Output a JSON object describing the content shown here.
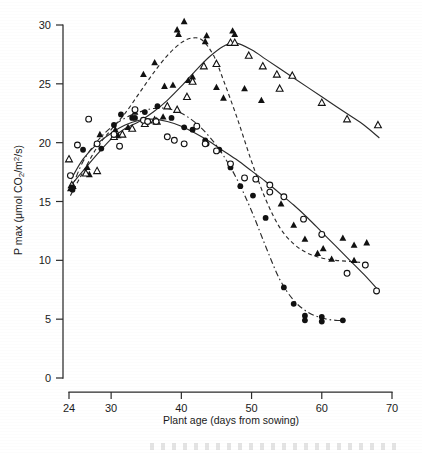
{
  "figure": {
    "background_color": "#ffffff",
    "ink_color": "#111111"
  },
  "chart_data": {
    "type": "scatter",
    "title": "",
    "subtitle": "",
    "xlabel": "Plant age (days from sowing)",
    "ylabel": "P max (μmol CO₂/m²/s)",
    "xlim": [
      24,
      70
    ],
    "ylim": [
      0,
      30
    ],
    "xticks": [
      24,
      30,
      40,
      50,
      60,
      70
    ],
    "xticklabels": [
      "24",
      "30",
      "40",
      "50",
      "60",
      "70"
    ],
    "yticks": [
      0,
      5,
      10,
      15,
      20,
      25,
      30
    ],
    "yticklabels": [
      "0",
      "5",
      "10",
      "15",
      "20",
      "25",
      "30"
    ],
    "grid": false,
    "legend": "none",
    "axis_style": "offset-spines",
    "series": [
      {
        "name": "filled-triangle",
        "marker": "triangle-filled",
        "line": "dashed",
        "points": [
          [
            24.0,
            18.6
          ],
          [
            24.2,
            16.1
          ],
          [
            24.6,
            16.3
          ],
          [
            26.6,
            17.9
          ],
          [
            26.9,
            17.3
          ],
          [
            28.4,
            20.7
          ],
          [
            30.6,
            21.1
          ],
          [
            31.0,
            20.6
          ],
          [
            32.4,
            21.3
          ],
          [
            33.4,
            22.6
          ],
          [
            34.6,
            25.8
          ],
          [
            36.2,
            26.8
          ],
          [
            37.4,
            22.2
          ],
          [
            37.6,
            24.8
          ],
          [
            38.8,
            24.9
          ],
          [
            39.4,
            29.6
          ],
          [
            39.6,
            29.2
          ],
          [
            40.4,
            30.3
          ],
          [
            41.0,
            25.3
          ],
          [
            41.6,
            25.6
          ],
          [
            43.4,
            28.6
          ],
          [
            43.6,
            29.1
          ],
          [
            45.0,
            24.7
          ],
          [
            46.0,
            23.8
          ],
          [
            47.3,
            29.5
          ],
          [
            47.6,
            29.2
          ],
          [
            49.0,
            24.6
          ],
          [
            51.4,
            23.6
          ],
          [
            54.2,
            14.8
          ],
          [
            56.0,
            13.0
          ],
          [
            57.6,
            11.8
          ],
          [
            59.4,
            10.6
          ],
          [
            60.2,
            11.0
          ],
          [
            61.4,
            10.1
          ],
          [
            63.0,
            11.9
          ],
          [
            64.6,
            11.3
          ],
          [
            64.6,
            10.0
          ],
          [
            66.4,
            11.5
          ]
        ]
      },
      {
        "name": "open-triangle",
        "marker": "triangle-open",
        "line": "solid",
        "points": [
          [
            24.0,
            18.6
          ],
          [
            24.4,
            16.4
          ],
          [
            26.4,
            17.4
          ],
          [
            28.0,
            17.6
          ],
          [
            30.4,
            20.5
          ],
          [
            31.6,
            20.7
          ],
          [
            33.0,
            21.2
          ],
          [
            34.8,
            21.6
          ],
          [
            36.2,
            21.9
          ],
          [
            36.5,
            21.8
          ],
          [
            38.0,
            23.1
          ],
          [
            39.4,
            22.8
          ],
          [
            40.8,
            23.9
          ],
          [
            41.6,
            25.2
          ],
          [
            43.2,
            26.5
          ],
          [
            45.0,
            26.7
          ],
          [
            47.0,
            28.5
          ],
          [
            47.6,
            28.5
          ],
          [
            49.6,
            27.4
          ],
          [
            51.6,
            26.5
          ],
          [
            53.6,
            25.8
          ],
          [
            54.0,
            24.6
          ],
          [
            55.8,
            25.7
          ],
          [
            60.0,
            23.4
          ],
          [
            63.6,
            22.0
          ],
          [
            68.0,
            21.5
          ]
        ]
      },
      {
        "name": "filled-circle",
        "marker": "circle-filled",
        "line": "dash-dot",
        "points": [
          [
            24.4,
            16.2
          ],
          [
            24.5,
            16.0
          ],
          [
            26.0,
            19.4
          ],
          [
            28.6,
            19.5
          ],
          [
            30.4,
            21.5
          ],
          [
            31.4,
            22.4
          ],
          [
            33.0,
            22.1
          ],
          [
            33.4,
            22.1
          ],
          [
            34.8,
            22.6
          ],
          [
            36.6,
            23.1
          ],
          [
            38.6,
            22.1
          ],
          [
            40.4,
            21.3
          ],
          [
            41.6,
            21.1
          ],
          [
            43.4,
            20.2
          ],
          [
            43.6,
            19.9
          ],
          [
            45.4,
            19.4
          ],
          [
            47.0,
            17.9
          ],
          [
            48.4,
            16.3
          ],
          [
            50.2,
            15.5
          ],
          [
            52.0,
            13.6
          ],
          [
            54.6,
            7.7
          ],
          [
            56.0,
            6.3
          ],
          [
            57.6,
            5.3
          ],
          [
            57.6,
            4.9
          ],
          [
            60.0,
            5.2
          ],
          [
            60.0,
            4.8
          ],
          [
            63.0,
            4.9
          ]
        ]
      },
      {
        "name": "open-circle",
        "marker": "circle-open",
        "line": "solid",
        "points": [
          [
            24.2,
            17.2
          ],
          [
            25.2,
            19.8
          ],
          [
            26.8,
            22.0
          ],
          [
            28.0,
            19.9
          ],
          [
            30.4,
            20.7
          ],
          [
            31.2,
            19.7
          ],
          [
            33.4,
            22.8
          ],
          [
            34.6,
            21.9
          ],
          [
            35.2,
            21.8
          ],
          [
            36.4,
            21.8
          ],
          [
            38.0,
            20.5
          ],
          [
            39.0,
            20.2
          ],
          [
            40.4,
            19.9
          ],
          [
            42.2,
            21.4
          ],
          [
            43.4,
            19.9
          ],
          [
            45.0,
            19.3
          ],
          [
            47.0,
            18.2
          ],
          [
            49.0,
            17.0
          ],
          [
            50.6,
            16.9
          ],
          [
            52.6,
            16.4
          ],
          [
            52.6,
            15.8
          ],
          [
            54.6,
            15.4
          ],
          [
            57.4,
            13.5
          ],
          [
            60.0,
            12.2
          ],
          [
            63.6,
            8.9
          ],
          [
            66.2,
            9.6
          ],
          [
            67.8,
            7.4
          ]
        ]
      }
    ],
    "fit_curves": [
      {
        "name": "filled-triangle-fit",
        "style": "dashed",
        "path": [
          [
            24.2,
            15.5
          ],
          [
            26,
            17.5
          ],
          [
            28,
            19.6
          ],
          [
            30,
            21.1
          ],
          [
            32,
            22.5
          ],
          [
            34,
            24.2
          ],
          [
            36,
            25.9
          ],
          [
            38,
            27.4
          ],
          [
            40,
            28.5
          ],
          [
            41.6,
            28.9
          ],
          [
            43,
            28.7
          ],
          [
            44.6,
            27.4
          ],
          [
            46,
            25.3
          ],
          [
            48,
            22.0
          ],
          [
            50,
            18.4
          ],
          [
            52,
            15.2
          ],
          [
            54,
            12.8
          ],
          [
            56,
            11.4
          ],
          [
            58,
            10.6
          ],
          [
            60,
            10.2
          ],
          [
            62,
            10.0
          ],
          [
            64,
            9.9
          ],
          [
            66,
            9.8
          ]
        ]
      },
      {
        "name": "open-triangle-fit",
        "style": "solid",
        "path": [
          [
            24.3,
            16.4
          ],
          [
            26,
            17.6
          ],
          [
            28,
            19.0
          ],
          [
            30,
            20.3
          ],
          [
            32,
            21.2
          ],
          [
            34,
            21.8
          ],
          [
            36,
            22.6
          ],
          [
            38,
            23.6
          ],
          [
            40,
            24.8
          ],
          [
            42,
            26.1
          ],
          [
            44,
            27.3
          ],
          [
            46,
            28.2
          ],
          [
            47.6,
            28.5
          ],
          [
            50,
            27.9
          ],
          [
            52,
            27.1
          ],
          [
            54,
            26.3
          ],
          [
            56,
            25.5
          ],
          [
            58,
            24.7
          ],
          [
            60,
            23.9
          ],
          [
            62,
            23.1
          ],
          [
            64,
            22.3
          ],
          [
            66,
            21.5
          ],
          [
            68.2,
            20.4
          ]
        ]
      },
      {
        "name": "filled-circle-fit",
        "style": "dash-dot",
        "path": [
          [
            24.3,
            16.0
          ],
          [
            26,
            18.4
          ],
          [
            28,
            20.1
          ],
          [
            30,
            21.3
          ],
          [
            32,
            22.1
          ],
          [
            34,
            22.6
          ],
          [
            36,
            22.9
          ],
          [
            38,
            22.9
          ],
          [
            40,
            22.5
          ],
          [
            42,
            21.7
          ],
          [
            44,
            20.5
          ],
          [
            46,
            18.9
          ],
          [
            48,
            16.8
          ],
          [
            50,
            14.2
          ],
          [
            52,
            11.2
          ],
          [
            54,
            8.4
          ],
          [
            56,
            6.6
          ],
          [
            58,
            5.6
          ],
          [
            60,
            5.1
          ],
          [
            62,
            4.9
          ],
          [
            63.4,
            4.9
          ]
        ]
      },
      {
        "name": "open-circle-fit",
        "style": "solid",
        "path": [
          [
            24.3,
            16.9
          ],
          [
            26,
            18.6
          ],
          [
            28,
            19.9
          ],
          [
            30,
            20.8
          ],
          [
            32,
            21.5
          ],
          [
            34,
            21.9
          ],
          [
            36,
            22.0
          ],
          [
            38,
            21.8
          ],
          [
            40,
            21.4
          ],
          [
            42,
            20.8
          ],
          [
            44,
            20.1
          ],
          [
            46,
            19.3
          ],
          [
            48,
            18.5
          ],
          [
            50,
            17.6
          ],
          [
            52,
            16.7
          ],
          [
            54,
            15.7
          ],
          [
            56,
            14.7
          ],
          [
            58,
            13.6
          ],
          [
            60,
            12.4
          ],
          [
            62,
            11.2
          ],
          [
            64,
            10.0
          ],
          [
            66,
            8.8
          ],
          [
            68,
            7.5
          ]
        ]
      }
    ]
  }
}
